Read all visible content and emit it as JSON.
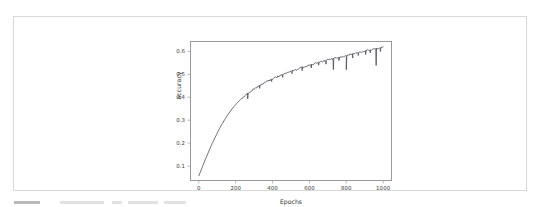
{
  "page": {
    "background_color": "#ffffff",
    "card_border_color": "#d9d9d9"
  },
  "figure": {
    "axes_frame_color": "#9a9a9a",
    "line_color": "#4a4a55",
    "tick_label_color": "#3a3a3a"
  },
  "chart_data": {
    "type": "line",
    "title": "",
    "xlabel": "Epochs",
    "ylabel": "accuracy",
    "xlim": [
      -48,
      1048
    ],
    "ylim": [
      0.035,
      0.645
    ],
    "grid": false,
    "legend": null,
    "xticks": [
      0,
      200,
      400,
      600,
      800,
      1000
    ],
    "xtick_labels": [
      "0",
      "200",
      "400",
      "600",
      "800",
      "1000"
    ],
    "yticks": [
      0.1,
      0.2,
      0.3,
      0.4,
      0.5,
      0.6
    ],
    "ytick_labels": [
      "0.1",
      "0.2",
      "0.3",
      "0.4",
      "0.5",
      "0.6"
    ],
    "series": [
      {
        "name": "accuracy",
        "color": "#4a4a55",
        "linewidth": 0.8,
        "x": [
          0,
          10,
          20,
          30,
          40,
          50,
          60,
          70,
          80,
          90,
          100,
          110,
          120,
          130,
          140,
          150,
          160,
          170,
          180,
          190,
          200,
          210,
          220,
          230,
          240,
          250,
          260,
          270,
          280,
          290,
          300,
          320,
          340,
          360,
          380,
          400,
          420,
          440,
          460,
          480,
          500,
          520,
          540,
          560,
          580,
          600,
          620,
          640,
          660,
          680,
          700,
          720,
          740,
          760,
          780,
          800,
          820,
          840,
          860,
          880,
          900,
          920,
          940,
          960,
          980,
          1000
        ],
        "y": [
          0.058,
          0.078,
          0.098,
          0.118,
          0.138,
          0.157,
          0.176,
          0.194,
          0.211,
          0.228,
          0.244,
          0.26,
          0.275,
          0.289,
          0.302,
          0.315,
          0.327,
          0.338,
          0.349,
          0.359,
          0.368,
          0.377,
          0.385,
          0.392,
          0.399,
          0.406,
          0.412,
          0.418,
          0.424,
          0.43,
          0.436,
          0.446,
          0.455,
          0.464,
          0.472,
          0.48,
          0.487,
          0.494,
          0.5,
          0.506,
          0.512,
          0.518,
          0.524,
          0.529,
          0.534,
          0.539,
          0.544,
          0.549,
          0.554,
          0.558,
          0.562,
          0.566,
          0.57,
          0.574,
          0.578,
          0.582,
          0.586,
          0.59,
          0.594,
          0.598,
          0.601,
          0.604,
          0.607,
          0.61,
          0.613,
          0.617
        ],
        "dropout_spikes": [
          {
            "x": 265,
            "depth": 0.022
          },
          {
            "x": 330,
            "depth": 0.012
          },
          {
            "x": 395,
            "depth": 0.01
          },
          {
            "x": 455,
            "depth": 0.012
          },
          {
            "x": 505,
            "depth": 0.011
          },
          {
            "x": 560,
            "depth": 0.013
          },
          {
            "x": 610,
            "depth": 0.014
          },
          {
            "x": 650,
            "depth": 0.012
          },
          {
            "x": 690,
            "depth": 0.016
          },
          {
            "x": 730,
            "depth": 0.048
          },
          {
            "x": 760,
            "depth": 0.014
          },
          {
            "x": 800,
            "depth": 0.062
          },
          {
            "x": 835,
            "depth": 0.018
          },
          {
            "x": 865,
            "depth": 0.013
          },
          {
            "x": 905,
            "depth": 0.016
          },
          {
            "x": 930,
            "depth": 0.012
          },
          {
            "x": 962,
            "depth": 0.072
          },
          {
            "x": 985,
            "depth": 0.015
          }
        ]
      }
    ]
  }
}
